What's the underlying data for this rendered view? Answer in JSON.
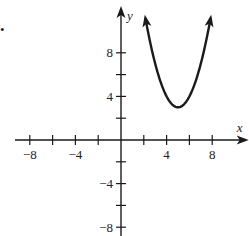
{
  "bullet": "•",
  "chart_data": {
    "type": "line",
    "title": "",
    "xlabel": "x",
    "ylabel": "y",
    "xlim": [
      -9.3,
      11.2
    ],
    "ylim": [
      -9.6,
      12.3
    ],
    "grid": false,
    "legend": null,
    "x_ticks": [
      -8,
      -6,
      -4,
      -2,
      2,
      4,
      6,
      8
    ],
    "x_tick_labels": [
      "-8",
      "-4",
      "4",
      "8"
    ],
    "x_tick_label_values": [
      -8,
      -4,
      4,
      8
    ],
    "y_ticks": [
      -8,
      -6,
      -4,
      -2,
      2,
      4,
      6,
      8
    ],
    "y_tick_labels": [
      "8",
      "4",
      "-4",
      "-8"
    ],
    "y_tick_label_values": [
      8,
      4,
      -4,
      -8
    ],
    "series": [
      {
        "name": "parabola",
        "equation": "y = (x - 5)^2 + 3",
        "vertex": [
          5,
          3
        ],
        "x": [
          2.2,
          2.5,
          3,
          3.5,
          4,
          4.5,
          5,
          5.5,
          6,
          6.5,
          7,
          7.5,
          7.8
        ],
        "values": [
          10.84,
          9.25,
          7,
          5.25,
          4,
          3.25,
          3,
          3.25,
          4,
          5.25,
          7,
          9.25,
          10.84
        ],
        "arrows_at_ends": true,
        "color": "#1a1a1a"
      }
    ]
  }
}
